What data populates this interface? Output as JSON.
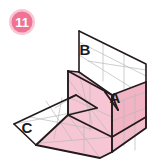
{
  "figure": {
    "step_badge": {
      "number": "11",
      "fill_color": "#ee7394",
      "halo_color": "#f9c6d4",
      "text_color": "#ffffff",
      "cx": 22,
      "cy": 22,
      "r": 11
    },
    "palette": {
      "paper_front": "#f6c6d4",
      "paper_front_dark": "#f2b3c5",
      "paper_back": "#ffffff",
      "outline": "#221a1c",
      "crease": "#b9b9b9",
      "background": "#ffffff"
    },
    "labels": [
      {
        "id": "label-a",
        "text": "A",
        "x": 115,
        "y": 103
      },
      {
        "id": "label-b",
        "text": "B",
        "x": 85,
        "y": 55
      },
      {
        "id": "label-c",
        "text": "C",
        "x": 27,
        "y": 133
      }
    ],
    "faces": [
      {
        "id": "face-b-back-panel",
        "name": "upper-white-panel-b",
        "fill": "#ffffff",
        "points": "79,31 146,64 146,82 79,72"
      },
      {
        "id": "face-inner-white-right",
        "name": "inner-white-panel-right",
        "fill": "#ffffff",
        "points": "79,72 146,64 146,82 112,95"
      },
      {
        "id": "face-c-white-panel",
        "name": "left-white-panel-c",
        "fill": "#ffffff",
        "points": "14,124 76,95 97,108 36,145"
      },
      {
        "id": "face-pink-front-left",
        "name": "pink-front-left",
        "fill": "#f6c6d4",
        "points": "68,71 79,72 112,95 112,137 68,115"
      },
      {
        "id": "face-pink-lower",
        "name": "pink-lower-flap",
        "fill": "#f6c6d4",
        "points": "36,145 68,115 112,137 112,152 100,158"
      },
      {
        "id": "face-pink-right",
        "name": "pink-right-panel",
        "fill": "#f2b3c5",
        "points": "112,95 146,82 146,128 112,152"
      }
    ],
    "creases": [
      {
        "id": "crease-b-1",
        "d": "M 79,42 L 146,76"
      },
      {
        "id": "crease-b-2",
        "d": "M 103,42 L 103,80"
      },
      {
        "id": "crease-b-3",
        "d": "M 124,53 L 124,88"
      },
      {
        "id": "crease-b-4",
        "d": "M 88,62 L 146,70"
      },
      {
        "id": "crease-r-1",
        "d": "M 112,104 L 146,92"
      },
      {
        "id": "crease-r-2",
        "d": "M 112,120 L 146,108"
      },
      {
        "id": "crease-r-3",
        "d": "M 124,99 L 124,145"
      },
      {
        "id": "crease-p-1",
        "d": "M 68,78 L 112,137"
      },
      {
        "id": "crease-p-2",
        "d": "M 79,72 L 90,120"
      },
      {
        "id": "crease-p-3",
        "d": "M 68,96 L 112,116"
      },
      {
        "id": "crease-c-1",
        "d": "M 30,118 L 90,128"
      },
      {
        "id": "crease-c-2",
        "d": "M 45,101 L 70,139"
      },
      {
        "id": "crease-c-3",
        "d": "M 60,98 L 60,134"
      },
      {
        "id": "crease-c-4",
        "d": "M 14,124 L 97,108"
      },
      {
        "id": "crease-low-1",
        "d": "M 36,145 L 112,137"
      },
      {
        "id": "crease-low-2",
        "d": "M 68,115 L 100,158"
      }
    ],
    "outlines": [
      {
        "id": "outline-b-panel",
        "d": "M 79,31 L 146,64 L 146,82 L 112,95 L 79,72 Z"
      },
      {
        "id": "outline-b-left-edge",
        "d": "M 79,31 L 79,72"
      },
      {
        "id": "outline-center-fold",
        "d": "M 68,71 L 68,115"
      },
      {
        "id": "outline-top-inner",
        "d": "M 68,71 L 79,72"
      },
      {
        "id": "outline-a-crease",
        "d": "M 112,95 L 118,108 L 112,95 L 105,104"
      },
      {
        "id": "outline-pink-body",
        "d": "M 68,71 L 112,95 L 112,152 L 100,158 L 36,145 L 68,115 Z"
      },
      {
        "id": "outline-right-panel",
        "d": "M 112,95 L 146,82 L 146,128 L 112,152"
      },
      {
        "id": "outline-pink-diag",
        "d": "M 68,115 L 112,137"
      },
      {
        "id": "outline-pink-diag2",
        "d": "M 112,137 L 146,117"
      },
      {
        "id": "outline-c-panel",
        "d": "M 14,124 L 76,95 L 97,108 L 36,145 Z"
      },
      {
        "id": "outline-c-inner",
        "d": "M 76,95 L 68,99"
      }
    ]
  }
}
